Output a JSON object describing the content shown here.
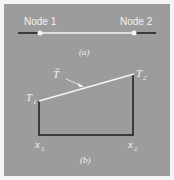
{
  "figure_a": {
    "node1_label": "Node 1",
    "node2_label": "Node 2",
    "caption": "(a)"
  },
  "figure_b": {
    "t1_label": "T",
    "t1_sub": "1",
    "t2_label": "T",
    "t2_sub": "2",
    "tilde_label": "T̃",
    "x1_label": "x",
    "x1_sub": "1",
    "x2_label": "x",
    "x2_sub": "2",
    "caption": "(b)"
  },
  "colors": {
    "panel": "#9c9c9c",
    "white_line": "#f5f5f5",
    "black_line": "#1a1a1a"
  }
}
